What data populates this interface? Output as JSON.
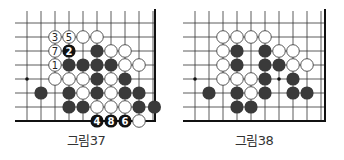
{
  "figures": [
    {
      "caption": "그림37",
      "origin": {
        "x": 27,
        "y": 23
      },
      "spacing": 14,
      "cols": 10,
      "rows": 8,
      "right_edge_x": 155,
      "bottom_edge_y": 121,
      "stars": [
        [
          0,
          4
        ]
      ],
      "stones": [
        {
          "c": 2,
          "r": 1,
          "color": "white",
          "label": "3"
        },
        {
          "c": 3,
          "r": 1,
          "color": "white",
          "label": "5"
        },
        {
          "c": 4,
          "r": 1,
          "color": "white"
        },
        {
          "c": 5,
          "r": 1,
          "color": "white"
        },
        {
          "c": 2,
          "r": 2,
          "color": "white",
          "label": "7"
        },
        {
          "c": 3,
          "r": 2,
          "color": "black",
          "label": "2"
        },
        {
          "c": 5,
          "r": 2,
          "color": "black"
        },
        {
          "c": 6,
          "r": 2,
          "color": "white"
        },
        {
          "c": 7,
          "r": 2,
          "color": "white"
        },
        {
          "c": 2,
          "r": 3,
          "color": "white",
          "label": "1"
        },
        {
          "c": 3,
          "r": 3,
          "color": "black"
        },
        {
          "c": 4,
          "r": 3,
          "color": "black"
        },
        {
          "c": 5,
          "r": 3,
          "color": "black"
        },
        {
          "c": 6,
          "r": 3,
          "color": "black"
        },
        {
          "c": 7,
          "r": 3,
          "color": "white"
        },
        {
          "c": 8,
          "r": 3,
          "color": "white"
        },
        {
          "c": 2,
          "r": 4,
          "color": "white"
        },
        {
          "c": 3,
          "r": 4,
          "color": "white"
        },
        {
          "c": 4,
          "r": 4,
          "color": "white"
        },
        {
          "c": 5,
          "r": 4,
          "color": "black"
        },
        {
          "c": 6,
          "r": 4,
          "color": "white"
        },
        {
          "c": 7,
          "r": 4,
          "color": "black"
        },
        {
          "c": 1,
          "r": 5,
          "color": "black"
        },
        {
          "c": 3,
          "r": 5,
          "color": "black"
        },
        {
          "c": 4,
          "r": 5,
          "color": "white"
        },
        {
          "c": 5,
          "r": 5,
          "color": "black"
        },
        {
          "c": 6,
          "r": 5,
          "color": "white"
        },
        {
          "c": 7,
          "r": 5,
          "color": "black"
        },
        {
          "c": 8,
          "r": 5,
          "color": "black"
        },
        {
          "c": 3,
          "r": 6,
          "color": "black"
        },
        {
          "c": 4,
          "r": 6,
          "color": "black"
        },
        {
          "c": 5,
          "r": 6,
          "color": "white"
        },
        {
          "c": 6,
          "r": 6,
          "color": "white"
        },
        {
          "c": 7,
          "r": 6,
          "color": "white"
        },
        {
          "c": 8,
          "r": 6,
          "color": "black"
        },
        {
          "c": 9.1,
          "r": 6,
          "color": "black"
        },
        {
          "c": 5,
          "r": 7,
          "color": "black",
          "label": "4"
        },
        {
          "c": 6,
          "r": 7,
          "color": "black",
          "label": "8"
        },
        {
          "c": 7,
          "r": 7,
          "color": "black",
          "label": "6"
        },
        {
          "c": 8,
          "r": 7,
          "color": "white"
        }
      ]
    },
    {
      "caption": "그림38",
      "origin": {
        "x": 195,
        "y": 23
      },
      "spacing": 14,
      "cols": 10,
      "rows": 8,
      "right_edge_x": 325,
      "bottom_edge_y": 121,
      "stars": [
        [
          0,
          4
        ],
        [
          6,
          4
        ]
      ],
      "stones": [
        {
          "c": 2,
          "r": 1,
          "color": "white"
        },
        {
          "c": 3,
          "r": 1,
          "color": "white"
        },
        {
          "c": 4,
          "r": 1,
          "color": "white"
        },
        {
          "c": 5,
          "r": 1,
          "color": "white"
        },
        {
          "c": 2,
          "r": 2,
          "color": "white"
        },
        {
          "c": 3,
          "r": 2,
          "color": "black"
        },
        {
          "c": 5,
          "r": 2,
          "color": "black"
        },
        {
          "c": 6,
          "r": 2,
          "color": "white"
        },
        {
          "c": 7,
          "r": 2,
          "color": "white"
        },
        {
          "c": 2,
          "r": 3,
          "color": "white"
        },
        {
          "c": 3,
          "r": 3,
          "color": "black"
        },
        {
          "c": 5,
          "r": 3,
          "color": "black"
        },
        {
          "c": 6,
          "r": 3,
          "color": "black"
        },
        {
          "c": 7,
          "r": 3,
          "color": "white"
        },
        {
          "c": 8,
          "r": 3,
          "color": "white"
        },
        {
          "c": 2,
          "r": 4,
          "color": "white"
        },
        {
          "c": 3,
          "r": 4,
          "color": "white"
        },
        {
          "c": 4,
          "r": 4,
          "color": "white"
        },
        {
          "c": 5,
          "r": 4,
          "color": "black"
        },
        {
          "c": 7,
          "r": 4,
          "color": "black"
        },
        {
          "c": 1,
          "r": 5,
          "color": "black"
        },
        {
          "c": 3,
          "r": 5,
          "color": "black"
        },
        {
          "c": 4,
          "r": 5,
          "color": "white"
        },
        {
          "c": 5,
          "r": 5,
          "color": "black"
        },
        {
          "c": 7,
          "r": 5,
          "color": "black"
        },
        {
          "c": 8,
          "r": 5,
          "color": "black"
        },
        {
          "c": 3,
          "r": 6,
          "color": "black"
        },
        {
          "c": 4,
          "r": 6,
          "color": "black"
        }
      ]
    }
  ],
  "colors": {
    "line": "#333333",
    "edge": "#111111",
    "black_stone": "#3a3a3a",
    "white_stone": "#ffffff",
    "stone_outline": "#444444",
    "caption": "#333333"
  }
}
